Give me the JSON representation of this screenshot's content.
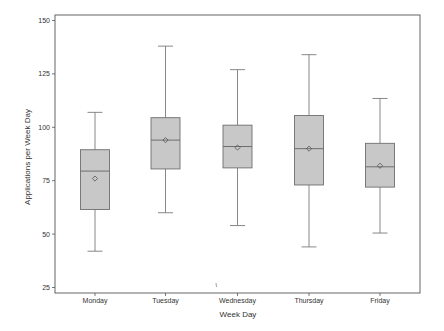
{
  "chart_data": {
    "type": "box",
    "title": "",
    "xlabel": "Week Day",
    "ylabel": "Applications per Week Day",
    "ylim": [
      25,
      150
    ],
    "yticks": [
      25,
      50,
      75,
      100,
      125,
      150
    ],
    "grid": false,
    "legend": null,
    "categories": [
      "Monday",
      "Tuesday",
      "Wednesday",
      "Thursday",
      "Friday"
    ],
    "boxes": [
      {
        "label": "Monday",
        "whisker_low": 42,
        "q1": 61.5,
        "median": 79.5,
        "q3": 89.5,
        "whisker_high": 107,
        "mean": 76
      },
      {
        "label": "Tuesday",
        "whisker_low": 60,
        "q1": 80.5,
        "median": 94,
        "q3": 104.5,
        "whisker_high": 138,
        "mean": 94
      },
      {
        "label": "Wednesday",
        "whisker_low": 54,
        "q1": 81,
        "median": 91,
        "q3": 101,
        "whisker_high": 127,
        "mean": 90.5
      },
      {
        "label": "Thursday",
        "whisker_low": 44,
        "q1": 73,
        "median": 90,
        "q3": 105.5,
        "whisker_high": 134,
        "mean": 90
      },
      {
        "label": "Friday",
        "whisker_low": 50.5,
        "q1": 72,
        "median": 81.5,
        "q3": 92.5,
        "whisker_high": 113.5,
        "mean": 82
      }
    ]
  },
  "style": {
    "box_fill": "#c8c8c8",
    "box_stroke": "#6e6e6e",
    "whisker_stroke": "#7a7a7a",
    "axis_stroke": "#555555",
    "mean_marker": "diamond"
  }
}
